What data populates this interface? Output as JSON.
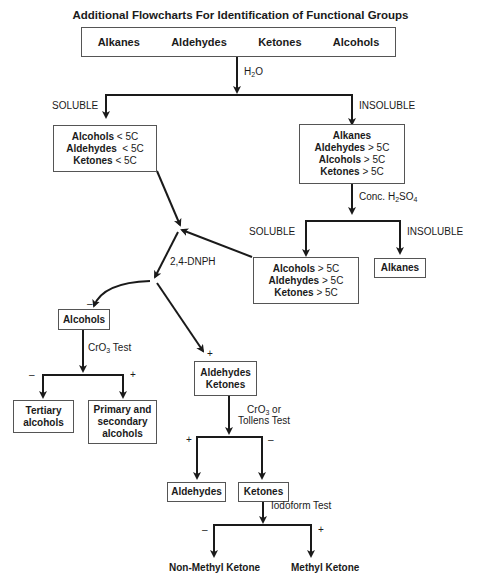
{
  "title": "Additional Flowcharts For Identification of Functional Groups",
  "top_box": {
    "items": [
      "Alkanes",
      "Aldehydes",
      "Ketones",
      "Alcohols"
    ]
  },
  "reagents": {
    "h2o": {
      "main": "H",
      "sub": "2",
      "rest": "O"
    },
    "conc_h2so4": {
      "pre": "Conc. H",
      "sub1": "2",
      "mid": "SO",
      "sub2": "4"
    },
    "dnph": "2,4-DNPH",
    "cro3_test": {
      "pre": "CrO",
      "sub": "3",
      "rest": " Test"
    },
    "cro3_tollens": {
      "pre": "CrO",
      "sub": "3",
      "rest": " or",
      "line2": "Tollens Test"
    },
    "iodoform": "Iodoform Test"
  },
  "branch_labels": {
    "soluble_1": "SOLUBLE",
    "insoluble_1": "INSOLUBLE",
    "soluble_2": "SOLUBLE",
    "insoluble_2": "INSOLUBLE"
  },
  "signs": {
    "minus": "–",
    "plus": "+"
  },
  "boxes": {
    "soluble_small": [
      {
        "name": "Alcohols",
        "cond": " < 5C"
      },
      {
        "name": "Aldehydes",
        "cond": "  < 5C"
      },
      {
        "name": "Ketones",
        "cond": " < 5C"
      }
    ],
    "insoluble_large": [
      {
        "name": "Alkanes",
        "cond": ""
      },
      {
        "name": "Aldehydes",
        "cond": " > 5C"
      },
      {
        "name": "Alcohols",
        "cond": " > 5C"
      },
      {
        "name": "Ketones",
        "cond": " > 5C"
      }
    ],
    "soluble_h2so4": [
      {
        "name": "Alcohols",
        "cond": " > 5C"
      },
      {
        "name": "Aldehydes",
        "cond": " > 5C"
      },
      {
        "name": "Ketones",
        "cond": " > 5C"
      }
    ],
    "alkanes": "Alkanes",
    "alcohols": "Alcohols",
    "aldehydes_ketones": [
      "Aldehydes",
      "Ketones"
    ],
    "tertiary": [
      "Tertiary",
      "alcohols"
    ],
    "primary_secondary": [
      "Primary and",
      "secondary",
      "alcohols"
    ],
    "aldehydes": "Aldehydes",
    "ketones": "Ketones"
  },
  "results": {
    "non_methyl": "Non-Methyl Ketone",
    "methyl": "Methyl Ketone"
  }
}
